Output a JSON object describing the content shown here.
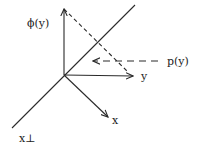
{
  "diagram": {
    "labels": {
      "phi_y": "ϕ(y)",
      "p_y": "p(y)",
      "y": "y",
      "x": "x",
      "x_perp": "x⊥"
    },
    "colors": {
      "ink": "#2a2a2a",
      "background": "#ffffff"
    },
    "elements": [
      {
        "id": "vertical-axis",
        "kind": "arrow",
        "label": "ϕ(y)"
      },
      {
        "id": "y-axis",
        "kind": "arrow",
        "label": "y"
      },
      {
        "id": "x-axis",
        "kind": "arrow",
        "label": "x"
      },
      {
        "id": "x-perp-line",
        "kind": "line",
        "label": "x⊥"
      },
      {
        "id": "projection-dashed-line",
        "kind": "dashed-line"
      },
      {
        "id": "p-y-arrow",
        "kind": "dashed-arrow",
        "label": "p(y)"
      }
    ]
  }
}
